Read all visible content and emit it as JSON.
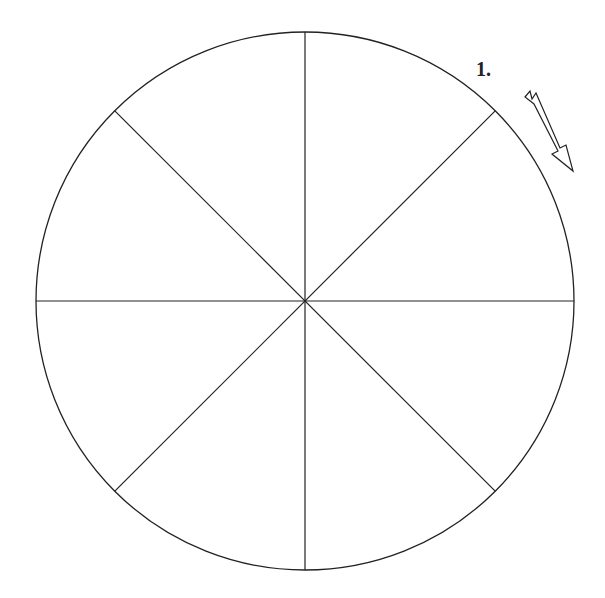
{
  "diagram": {
    "type": "divided-circle",
    "segments": 8,
    "center": [
      305,
      301
    ],
    "radius": 269,
    "stroke_color": "#222222",
    "background": "#ffffff",
    "label": {
      "text": "1.",
      "position": [
        476,
        76
      ]
    },
    "arrow": {
      "direction": "clockwise",
      "icon": "hollow-arrow-down-right"
    }
  }
}
